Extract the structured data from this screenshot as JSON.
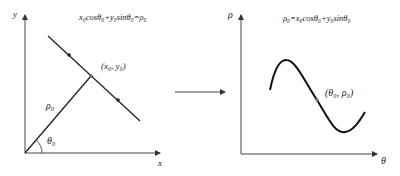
{
  "left_panel": {
    "y_axis_label": "y",
    "x_axis_label": "x",
    "equation": "x₀cosθ₀+y₀sinθ₀=ρ₀",
    "point_label": "(x₀, y₀)",
    "rho_label": "ρ₀",
    "theta_label": "θ₀"
  },
  "arrow": {
    "direction": "right"
  },
  "right_panel": {
    "y_axis_label": "ρ",
    "x_axis_label": "θ",
    "equation": "ρ₀=x₀cosθ₀+y₀sinθ₀",
    "point_label": "(θ₀, ρ₀)"
  }
}
